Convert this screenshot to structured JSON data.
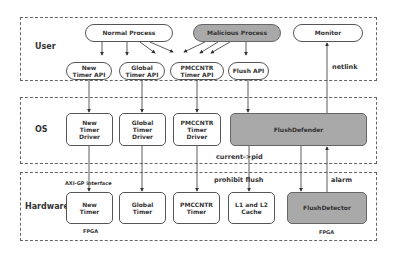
{
  "layers": {
    "user": {
      "label": "User"
    },
    "os": {
      "label": "OS"
    },
    "hardware": {
      "label": "Hardware"
    }
  },
  "user": {
    "normal_process": "Normal Process",
    "malicious_process": "Malicious Process",
    "monitor": "Monitor",
    "apis": [
      {
        "label": "New\nTimer API"
      },
      {
        "label": "Global\nTimer API"
      },
      {
        "label": "PMCCNTR\nTimer API"
      },
      {
        "label": "Flush API"
      }
    ]
  },
  "os": {
    "drivers": [
      {
        "label": "New\nTimer\nDriver"
      },
      {
        "label": "Global\nTimer\nDriver"
      },
      {
        "label": "PMCCNTR\nTimer\nDriver"
      }
    ],
    "flush_defender": "FlushDefender"
  },
  "hardware": {
    "units": [
      {
        "label": "New\nTimer"
      },
      {
        "label": "Global\nTimer"
      },
      {
        "label": "PMCCNTR\nTimer"
      },
      {
        "label": "L1 and L2\nCache"
      }
    ],
    "flush_detector": "FlushDetector",
    "fpga_left": "FPGA",
    "fpga_right": "FPGA"
  },
  "edge_labels": {
    "netlink": "netlink",
    "current_pid": "current->pid",
    "axi_gp": "AXI-GP  interface",
    "prohibit_flush": "prohibit  flush",
    "alarm": "alarm"
  },
  "colors": {
    "highlight_fill": "#a9a9a9",
    "border": "#555555"
  }
}
